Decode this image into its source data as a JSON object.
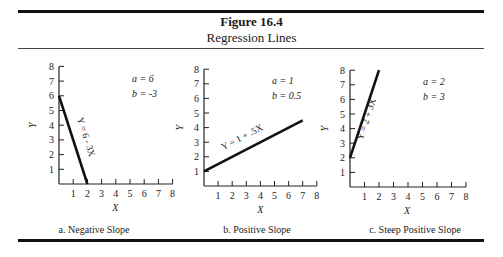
{
  "figure": {
    "title": "Figure 16.4",
    "subtitle": "Regression Lines"
  },
  "chart_data": [
    {
      "type": "line",
      "panel": "a",
      "caption": "a. Negative Slope",
      "xlabel": "X",
      "ylabel": "Y",
      "xticks": [
        1,
        2,
        3,
        4,
        5,
        6,
        7,
        8
      ],
      "yticks": [
        1,
        2,
        3,
        4,
        5,
        6,
        7,
        8
      ],
      "xlim": [
        0,
        8
      ],
      "ylim": [
        0,
        8
      ],
      "grid": false,
      "line_label": "Y = 6 - 3X",
      "params": {
        "a_label": "a = 6",
        "b_label": "b = -3",
        "a": 6,
        "b": -3
      },
      "x": [
        0,
        2
      ],
      "y": [
        6,
        0
      ]
    },
    {
      "type": "line",
      "panel": "b",
      "caption": "b. Positive Slope",
      "xlabel": "X",
      "ylabel": "Y",
      "xticks": [
        1,
        2,
        3,
        4,
        5,
        6,
        7,
        8
      ],
      "yticks": [
        1,
        2,
        3,
        4,
        5,
        6,
        7,
        8
      ],
      "xlim": [
        0,
        8
      ],
      "ylim": [
        0,
        8
      ],
      "grid": false,
      "line_label": "Y = 1 + .5X",
      "params": {
        "a_label": "a = 1",
        "b_label": "b = 0.5",
        "a": 1,
        "b": 0.5
      },
      "x": [
        0,
        7
      ],
      "y": [
        1,
        4.5
      ]
    },
    {
      "type": "line",
      "panel": "c",
      "caption": "c. Steep Positive  Slope",
      "xlabel": "X",
      "ylabel": "Y",
      "xticks": [
        1,
        2,
        3,
        4,
        5,
        6,
        7,
        8
      ],
      "yticks": [
        1,
        2,
        3,
        4,
        5,
        6,
        7,
        8
      ],
      "xlim": [
        0,
        8
      ],
      "ylim": [
        0,
        8
      ],
      "grid": false,
      "line_label": "Y = 2 + 3X",
      "params": {
        "a_label": "a = 2",
        "b_label": "b = 3",
        "a": 2,
        "b": 3
      },
      "x": [
        0,
        2
      ],
      "y": [
        2,
        8
      ]
    }
  ]
}
